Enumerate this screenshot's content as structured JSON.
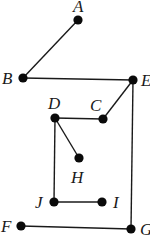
{
  "diagram": {
    "type": "graph",
    "colors": {
      "edge": "#1a1a1a",
      "node": "#0a0a0a",
      "background": "#ffffff"
    },
    "nodes": [
      {
        "id": "A",
        "label": "A",
        "x": 78,
        "y": 20,
        "lx": 73,
        "ly": 12
      },
      {
        "id": "B",
        "label": "B",
        "x": 23,
        "y": 78,
        "lx": 2,
        "ly": 84
      },
      {
        "id": "E",
        "label": "E",
        "x": 133,
        "y": 80,
        "lx": 141,
        "ly": 86
      },
      {
        "id": "D",
        "label": "D",
        "x": 55,
        "y": 118,
        "lx": 48,
        "ly": 109
      },
      {
        "id": "C",
        "label": "C",
        "x": 103,
        "y": 119,
        "lx": 90,
        "ly": 111
      },
      {
        "id": "H",
        "label": "H",
        "x": 79,
        "y": 158,
        "lx": 71,
        "ly": 183
      },
      {
        "id": "J",
        "label": "J",
        "x": 54,
        "y": 202,
        "lx": 35,
        "ly": 208
      },
      {
        "id": "I",
        "label": "I",
        "x": 102,
        "y": 202,
        "lx": 113,
        "ly": 208
      },
      {
        "id": "F",
        "label": "F",
        "x": 21,
        "y": 226,
        "lx": 1,
        "ly": 232
      },
      {
        "id": "G",
        "label": "G",
        "x": 131,
        "y": 229,
        "lx": 140,
        "ly": 235
      }
    ],
    "edges": [
      [
        "A",
        "B"
      ],
      [
        "B",
        "E"
      ],
      [
        "E",
        "C"
      ],
      [
        "E",
        "G"
      ],
      [
        "C",
        "D"
      ],
      [
        "D",
        "H"
      ],
      [
        "D",
        "J"
      ],
      [
        "J",
        "I"
      ],
      [
        "F",
        "G"
      ]
    ]
  }
}
